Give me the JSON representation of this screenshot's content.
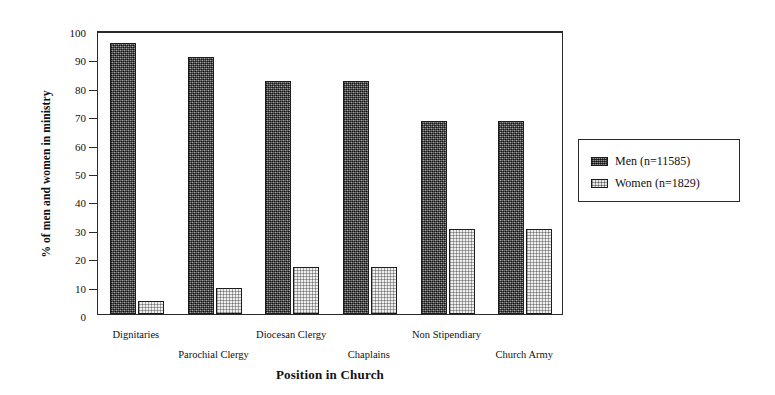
{
  "chart_data": {
    "type": "bar",
    "title": "",
    "xlabel": "Position in Church",
    "ylabel": "% of men and women in ministry",
    "categories": [
      "Dignitaries",
      "Parochial Clergy",
      "Diocesan Clergy",
      "Chaplains",
      "Non Stipendiary",
      "Church Army"
    ],
    "series": [
      {
        "name": "Men (n=11585)",
        "values": [
          95.5,
          90.5,
          82,
          82,
          68,
          68
        ]
      },
      {
        "name": "Women (n=1829)",
        "values": [
          4.5,
          9,
          16.5,
          16.5,
          30,
          30
        ]
      }
    ],
    "ylim": [
      0,
      100
    ],
    "yticks": [
      0,
      10,
      20,
      30,
      40,
      50,
      60,
      70,
      80,
      90,
      100
    ],
    "ytick_labels": [
      "0",
      "10",
      "20",
      "30",
      "40",
      "50",
      "60",
      "70",
      "80",
      "90",
      "100"
    ],
    "grid": false,
    "legend_position": "right-outside",
    "legend_entries": [
      "Men (n=11585)",
      "Women (n=1829)"
    ],
    "xlabel_rows": [
      0,
      1,
      0,
      1,
      0,
      1
    ]
  }
}
